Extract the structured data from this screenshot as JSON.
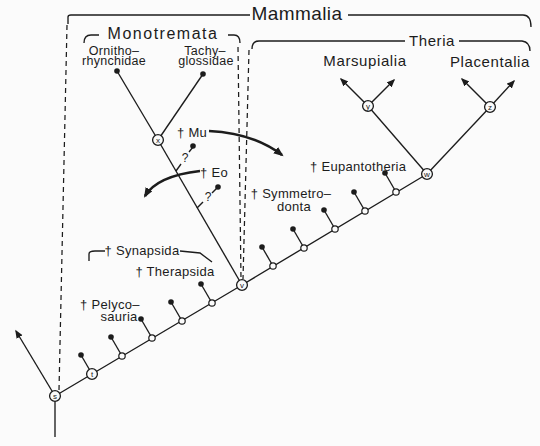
{
  "figure": {
    "title": "Mammalia",
    "clades": {
      "monotremata": "Monotremata",
      "theria": "Theria",
      "marsupialia": "Marsupialia",
      "placentalia": "Placentalia"
    },
    "terminal_taxa": {
      "ornithorhynchidae_line1": "Ornitho–",
      "ornithorhynchidae_line2": "rhynchidae",
      "tachyglossidae_line1": "Tachy–",
      "tachyglossidae_line2": "glossidae"
    },
    "extinct_taxa": {
      "mu": "† Mu",
      "eo": "† Eo",
      "eupantotheria": "† Eupantotheria",
      "symmetrodonta_line1": "† Symmetro–",
      "symmetrodonta_line2": "donta",
      "synapsida": "† Synapsida",
      "therapsida": "† Therapsida",
      "pelycosauria_line1": "† Pelyco–",
      "pelycosauria_line2": "sauria"
    },
    "node_labels": {
      "s": "s",
      "t": "t",
      "v": "v",
      "w": "w",
      "x": "x",
      "y": "y",
      "z": "z"
    },
    "uncertainty_marks": {
      "mu": "?",
      "eo": "?"
    },
    "colors": {
      "ink": "#1c1c1c",
      "background": "#fbfbfb"
    }
  }
}
